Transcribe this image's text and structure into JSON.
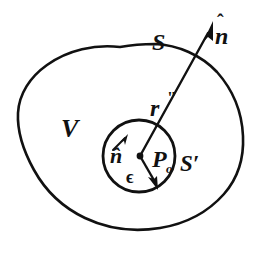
{
  "figure": {
    "background_color": "#ffffff",
    "stroke_color": "#111111",
    "width": 259,
    "height": 254
  },
  "labels": {
    "outer_surface": "S",
    "volume": "V",
    "distance_vector": "r",
    "distance_vector_primes": "\"",
    "inner_surface": "S′",
    "center_point": "P",
    "center_point_subscript": "o",
    "outer_normal": "n",
    "outer_normal_hat": "ˆ",
    "inner_normal": "n̂",
    "radius": "ϵ"
  },
  "shapes": {
    "outer_blob": {
      "name": "outer-surface-boundary",
      "path": "M 118 47 C 86 45, 56 56, 34 80 C 18 98, 15 122, 23 145 C 31 170, 47 192, 70 206 C 96 222, 128 227, 158 222 C 188 217, 214 201, 228 178 C 240 158, 241 134, 236 112 C 230 86, 216 65, 194 54 C 171 43, 144 44, 118 47 Z"
    },
    "inner_circle": {
      "name": "inner-surface-circle",
      "cx": 139,
      "cy": 156,
      "r": 36
    },
    "normal_arrow": {
      "name": "outer-normal-arrow",
      "x1": 139,
      "y1": 156,
      "x2": 212,
      "y2": 26
    },
    "epsilon_arrow": {
      "name": "radius-arrow",
      "x1": 139,
      "y1": 156,
      "x2": 157,
      "y2": 186
    },
    "inner_normal_arrow": {
      "name": "inner-normal-arrow",
      "x1": 113,
      "y1": 150,
      "x2": 127,
      "y2": 135
    }
  }
}
